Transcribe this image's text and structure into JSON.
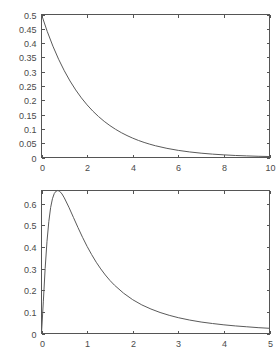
{
  "figure": {
    "background_color": "#ffffff",
    "axis_color": "#555555",
    "curve_color": "#5a5a5a",
    "label_color": "#4a4a4a"
  },
  "chart_data": [
    {
      "id": "top",
      "type": "line",
      "title": "",
      "subtitle": "",
      "xlabel": "",
      "ylabel": "",
      "grid": false,
      "legend": false,
      "legend_position": "none",
      "xlim": [
        0,
        10
      ],
      "ylim": [
        0,
        0.5
      ],
      "xticks": [
        0,
        2,
        4,
        6,
        8,
        10
      ],
      "xtick_labels": [
        "0",
        "2",
        "4",
        "6",
        "8",
        "10"
      ],
      "yticks": [
        0,
        0.05,
        0.1,
        0.15,
        0.2,
        0.25,
        0.3,
        0.35,
        0.4,
        0.45,
        0.5
      ],
      "ytick_labels": [
        "0",
        "0.05",
        "0.1",
        "0.15",
        "0.2",
        "0.25",
        "0.3",
        "0.35",
        "0.4",
        "0.45",
        "0.5"
      ],
      "series": [
        {
          "name": "density",
          "x": [
            0,
            0.25,
            0.5,
            0.75,
            1,
            1.25,
            1.5,
            1.75,
            2,
            2.25,
            2.5,
            2.75,
            3,
            3.25,
            3.5,
            3.75,
            4,
            4.25,
            4.5,
            4.75,
            5,
            5.5,
            6,
            6.5,
            7,
            7.5,
            8,
            8.5,
            9,
            9.5,
            10
          ],
          "y": [
            0.5,
            0.4412,
            0.3894,
            0.3436,
            0.3033,
            0.2676,
            0.2362,
            0.2084,
            0.1839,
            0.1623,
            0.1433,
            0.1264,
            0.1116,
            0.0985,
            0.0869,
            0.0767,
            0.0677,
            0.0597,
            0.0527,
            0.0465,
            0.041,
            0.032,
            0.0249,
            0.0194,
            0.0151,
            0.0118,
            0.0092,
            0.0071,
            0.0056,
            0.0043,
            0.0034
          ]
        }
      ]
    },
    {
      "id": "bottom",
      "type": "line",
      "title": "",
      "subtitle": "",
      "xlabel": "",
      "ylabel": "",
      "grid": false,
      "legend": false,
      "legend_position": "none",
      "xlim": [
        0,
        5
      ],
      "ylim": [
        0,
        0.66
      ],
      "xticks": [
        0,
        1,
        2,
        3,
        4,
        5
      ],
      "xtick_labels": [
        "0",
        "1",
        "2",
        "3",
        "4",
        "5"
      ],
      "yticks": [
        0,
        0.1,
        0.2,
        0.3,
        0.4,
        0.5,
        0.6
      ],
      "ytick_labels": [
        "0",
        "0.1",
        "0.2",
        "0.3",
        "0.4",
        "0.5",
        "0.6"
      ],
      "peak": {
        "x": 0.36,
        "y": 0.66
      },
      "series": [
        {
          "name": "density",
          "x": [
            0,
            0.04,
            0.08,
            0.12,
            0.16,
            0.2,
            0.24,
            0.28,
            0.32,
            0.36,
            0.4,
            0.45,
            0.5,
            0.6,
            0.7,
            0.8,
            0.9,
            1.0,
            1.1,
            1.2,
            1.3,
            1.4,
            1.5,
            1.6,
            1.8,
            2.0,
            2.2,
            2.4,
            2.6,
            2.8,
            3.0,
            3.25,
            3.5,
            3.75,
            4.0,
            4.25,
            4.5,
            4.75,
            5.0
          ],
          "y": [
            0,
            0.146,
            0.3,
            0.424,
            0.516,
            0.581,
            0.622,
            0.646,
            0.657,
            0.66,
            0.656,
            0.644,
            0.626,
            0.583,
            0.536,
            0.489,
            0.444,
            0.402,
            0.364,
            0.329,
            0.298,
            0.27,
            0.245,
            0.223,
            0.186,
            0.156,
            0.132,
            0.113,
            0.097,
            0.084,
            0.073,
            0.062,
            0.053,
            0.046,
            0.04,
            0.035,
            0.031,
            0.027,
            0.024
          ]
        }
      ]
    }
  ]
}
